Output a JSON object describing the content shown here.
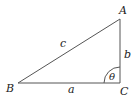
{
  "diagram": {
    "type": "right-triangle",
    "vertices": {
      "A": {
        "label": "A",
        "x": 120,
        "y": 19
      },
      "B": {
        "label": "B",
        "x": 18,
        "y": 83
      },
      "C": {
        "label": "C",
        "x": 120,
        "y": 83
      }
    },
    "sides": {
      "a": {
        "label": "a",
        "between": [
          "B",
          "C"
        ]
      },
      "b": {
        "label": "b",
        "between": [
          "C",
          "A"
        ]
      },
      "c": {
        "label": "c",
        "between": [
          "A",
          "B"
        ]
      }
    },
    "angle": {
      "label": "θ",
      "at": "C"
    },
    "stroke_color": "#555555"
  }
}
